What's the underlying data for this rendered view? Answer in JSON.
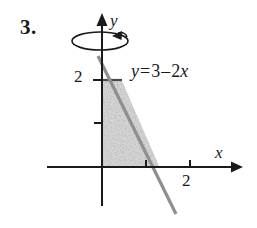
{
  "figure": {
    "problem_number": "3.",
    "axis_labels": {
      "x": "x",
      "y": "y"
    },
    "tick_labels": {
      "y_2": "2",
      "x_2": "2"
    },
    "equation": {
      "lhs": "y",
      "equals": "=",
      "intercept": "3",
      "minus": "–",
      "coefficient": "2",
      "variable": "x",
      "full": "y = 3 – 2x"
    },
    "colors": {
      "axis": "#1a1a1a",
      "curve": "#8f8f8f",
      "region_fill": "#d2d2d2",
      "region_edge": "#555555",
      "text": "#1a1a1a",
      "background": "#ffffff"
    },
    "icons": {
      "rotation_indicator": "revolution-ellipse-arrow-icon",
      "y_axis_arrow": "axis-arrowhead-icon",
      "x_axis_arrow": "axis-arrowhead-icon"
    }
  },
  "chart_data": {
    "type": "line",
    "title": "",
    "xlabel": "x",
    "ylabel": "y",
    "xlim": [
      -1,
      2.8
    ],
    "ylim": [
      -1,
      3.2
    ],
    "grid": false,
    "legend": "none",
    "series": [
      {
        "name": "y = 3 - 2x",
        "equation": "y = 3 - 2x",
        "slope": -2,
        "y_intercept": 3,
        "x_intercept": 1.5,
        "x": [
          -0.15,
          2.25
        ],
        "y": [
          3.3,
          -1.5
        ]
      }
    ],
    "shaded_region": {
      "label": "region bounded by y = 3 - 2x, x = 0, y = 0, y = 2",
      "fill": "#d2d2d2",
      "vertices": [
        [
          0,
          0
        ],
        [
          0,
          2
        ],
        [
          0.5,
          2
        ],
        [
          1.5,
          0
        ]
      ]
    },
    "annotations": [
      {
        "text": "y = 3 – 2x",
        "x": 0.65,
        "y": 2.55
      },
      {
        "text": "revolution about the y-axis",
        "x": 0,
        "y": 2.9
      }
    ],
    "ticks": {
      "x": [
        1,
        2
      ],
      "x_labeled": {
        "2": "2"
      },
      "y": [
        1,
        2
      ],
      "y_labeled": {
        "2": "2"
      }
    }
  }
}
